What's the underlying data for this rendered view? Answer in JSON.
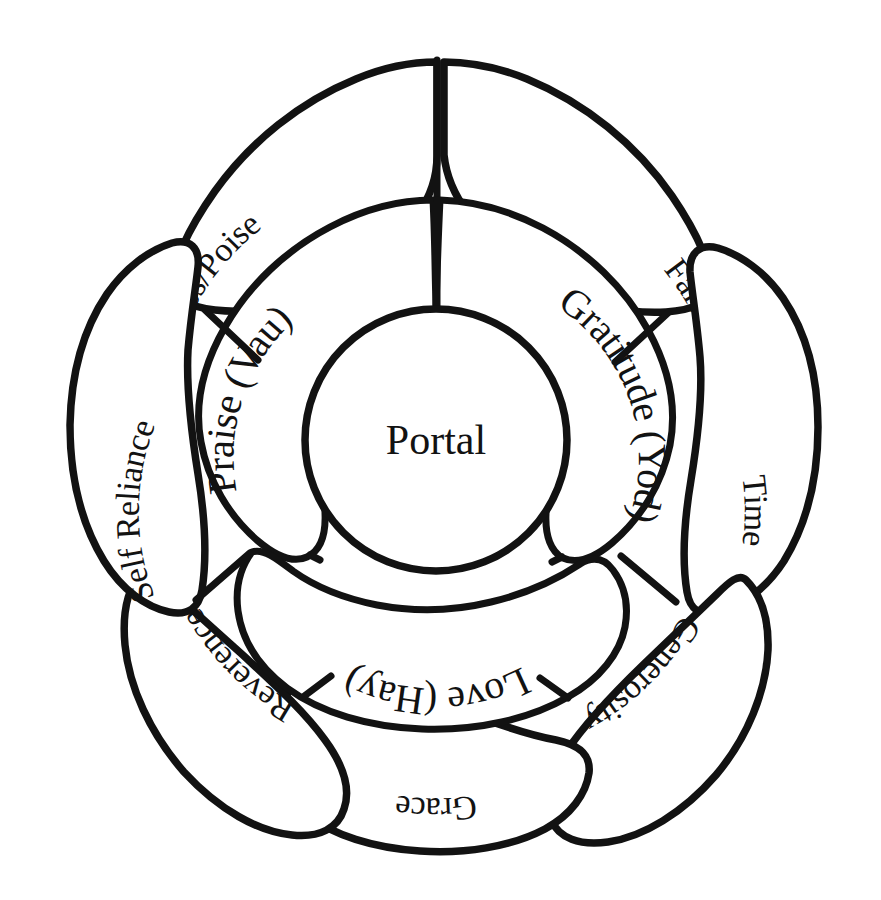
{
  "diagram": {
    "title": "Portal",
    "type": "concentric-petal-flower",
    "style": {
      "background_color": "#ffffff",
      "stroke_color": "#121212",
      "fill_color": "#ffffff"
    },
    "core": {
      "label": "Portal"
    },
    "inner_ring": {
      "count": 3,
      "petals": [
        {
          "label": "Praise (Vau)",
          "position": "upper-left",
          "text_orientation": "arc-ccw"
        },
        {
          "label": "Gratitude (Yod)",
          "position": "upper-right",
          "text_orientation": "arc-cw"
        },
        {
          "label": "Love (Hay)",
          "position": "bottom",
          "text_orientation": "inverted-arc"
        }
      ]
    },
    "outer_ring": {
      "count": 7,
      "petals": [
        {
          "label": "Calmness/Poise",
          "position": "top-left",
          "text_orientation": "tilted-ccw"
        },
        {
          "label": "Failure",
          "position": "top-right",
          "text_orientation": "tilted-cw"
        },
        {
          "label": "Time",
          "position": "right",
          "text_orientation": "rotated-90-cw"
        },
        {
          "label": "Generosity",
          "position": "lower-right",
          "text_orientation": "rotated-180"
        },
        {
          "label": "Grace",
          "position": "bottom",
          "text_orientation": "rotated-180"
        },
        {
          "label": "Reverence",
          "position": "lower-left",
          "text_orientation": "rotated-180"
        },
        {
          "label": "Self Reliance",
          "position": "left",
          "text_orientation": "rotated-90-ccw"
        }
      ]
    }
  }
}
